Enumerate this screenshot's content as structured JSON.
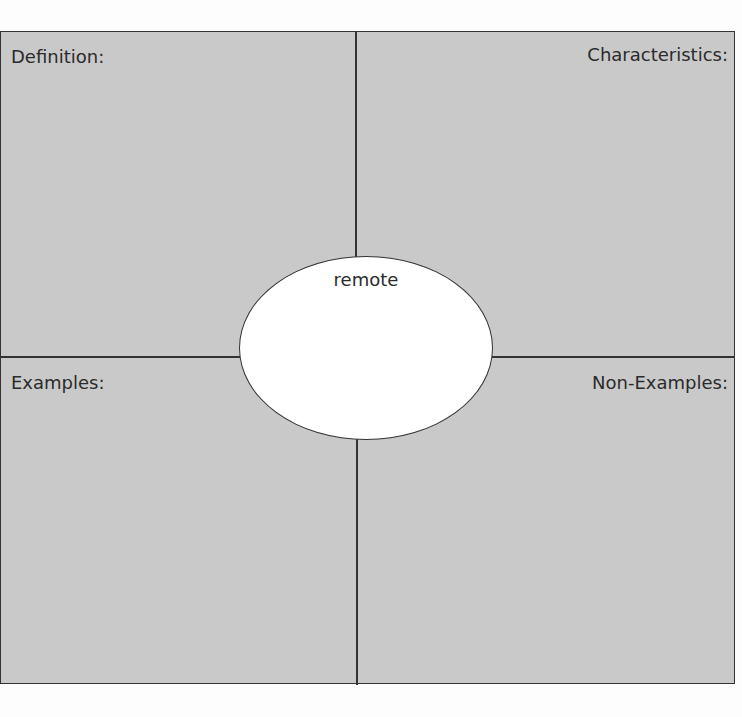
{
  "organizer": {
    "type": "Frayer model",
    "quadrants": {
      "top_left": "Definition:",
      "top_right": "Characteristics:",
      "bottom_left": "Examples:",
      "bottom_right": "Non-Examples:"
    },
    "center_word": "remote"
  }
}
